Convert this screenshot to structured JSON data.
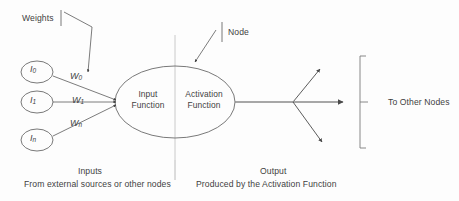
{
  "diagram": {
    "background_color": "#fdfdfd",
    "stroke_color": "#5a5a5a",
    "text_color": "#3f3f3f"
  },
  "annotations": {
    "weights_label": "Weights",
    "node_label": "Node",
    "to_other_nodes_label": "To Other Nodes"
  },
  "neuron": {
    "input_function_line1": "Input",
    "input_function_line2": "Function",
    "activation_function_line1": "Activation",
    "activation_function_line2": "Function"
  },
  "inputs": [
    {
      "node_label": "I",
      "node_sub": "0",
      "weight_label": "W",
      "weight_sub": "0"
    },
    {
      "node_label": "I",
      "node_sub": "1",
      "weight_label": "W",
      "weight_sub": "1"
    },
    {
      "node_label": "I",
      "node_sub": "n",
      "weight_label": "W",
      "weight_sub": "n"
    }
  ],
  "captions": {
    "inputs_heading": "Inputs",
    "inputs_subtext": "From external sources or other nodes",
    "output_heading": "Output",
    "output_subtext": "Produced by the Activation Function"
  }
}
